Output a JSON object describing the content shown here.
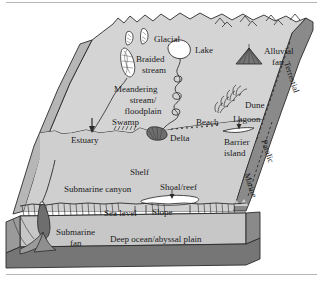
{
  "colors": {
    "top_surface": "#d4d4d4",
    "shelf_surface": "#cfcfcf",
    "right_face": "#8a8a8a",
    "front_face": "#bdbdbd",
    "base_band": "#767676",
    "deep_band": "#9a9a9a",
    "outline": "#2b2b2b",
    "water_white": "#ffffff",
    "rule": "#b4b4b4",
    "text": "#1a1a1a"
  },
  "labels": {
    "glacial": "Glacial",
    "braided_stream": "Braided",
    "braided_stream2": "stream",
    "lake": "Lake",
    "alluvial_fan": "Alluvial",
    "alluvial_fan2": "fan",
    "meandering": "Meandering",
    "meandering2": "stream/",
    "meandering3": "floodplain",
    "swamp": "Swamp",
    "estuary": "Estuary",
    "delta": "Delta",
    "beach": "Beach",
    "dune": "Dune",
    "lagoon": "Lagoon",
    "barrier_island": "Barrier",
    "barrier_island2": "island",
    "shelf": "Shelf",
    "submarine_canyon": "Submarine canyon",
    "shoal_reef": "Shoal/reef",
    "sea_level": "Sea level",
    "slope": "Slope",
    "submarine_fan": "Submarine",
    "submarine_fan2": "fan",
    "deep_ocean": "Deep ocean/abyssal  plain",
    "terrestial": "Terrestial",
    "paralic": "Paralic",
    "marine": "Marine"
  },
  "icons": {
    "glacier": "glacier-icon",
    "lake": "lake-icon",
    "alluvial_fan": "alluvial-fan-icon",
    "braided_stream": "braided-stream-icon",
    "meandering_river": "meandering-river-icon",
    "swamp": "swamp-marks-icon",
    "delta": "delta-icon",
    "beach_dots": "beach-dots-icon",
    "dune": "dune-grass-icon",
    "lagoon_arrow": "lagoon-arrow-icon",
    "shoal_arrow": "shoal-arrow-icon",
    "mountains": "mountain-peaks-icon",
    "slope_hatch": "slope-hatch-icon",
    "submarine_fan": "submarine-fan-icon"
  }
}
